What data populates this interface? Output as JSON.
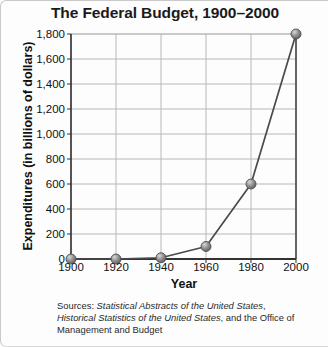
{
  "chart_data": {
    "type": "line",
    "title": "The Federal Budget, 1900–2000",
    "xlabel": "Year",
    "ylabel": "Expenditures (in billions of dollars)",
    "x": [
      1900,
      1920,
      1940,
      1960,
      1980,
      2000
    ],
    "values": [
      0,
      0,
      10,
      100,
      600,
      1800
    ],
    "xtick_labels": [
      "1900",
      "1920",
      "1940",
      "1960",
      "1980",
      "2000"
    ],
    "ytick_labels": [
      "0",
      "200",
      "400",
      "600",
      "800",
      "1,000",
      "1,200",
      "1,400",
      "1,600",
      "1,800"
    ],
    "ytick_values": [
      0,
      200,
      400,
      600,
      800,
      1000,
      1200,
      1400,
      1600,
      1800
    ],
    "xlim": [
      1900,
      2000
    ],
    "ylim": [
      0,
      1800
    ],
    "grid": "horizontal-and-vertical",
    "legend": "none",
    "marker": "sphere",
    "line_color": "#4a4a4a",
    "marker_color": "#8a8a8a",
    "grid_color": "#b8b8b8",
    "axis_color": "#333333"
  },
  "source": {
    "prefix": "Sources:",
    "work_one": "Statistical Abstracts of the United States",
    "separator_one": ",",
    "work_two": "Historical Statistics of the United States",
    "suffix": ", and the Office of Management and Budget"
  }
}
